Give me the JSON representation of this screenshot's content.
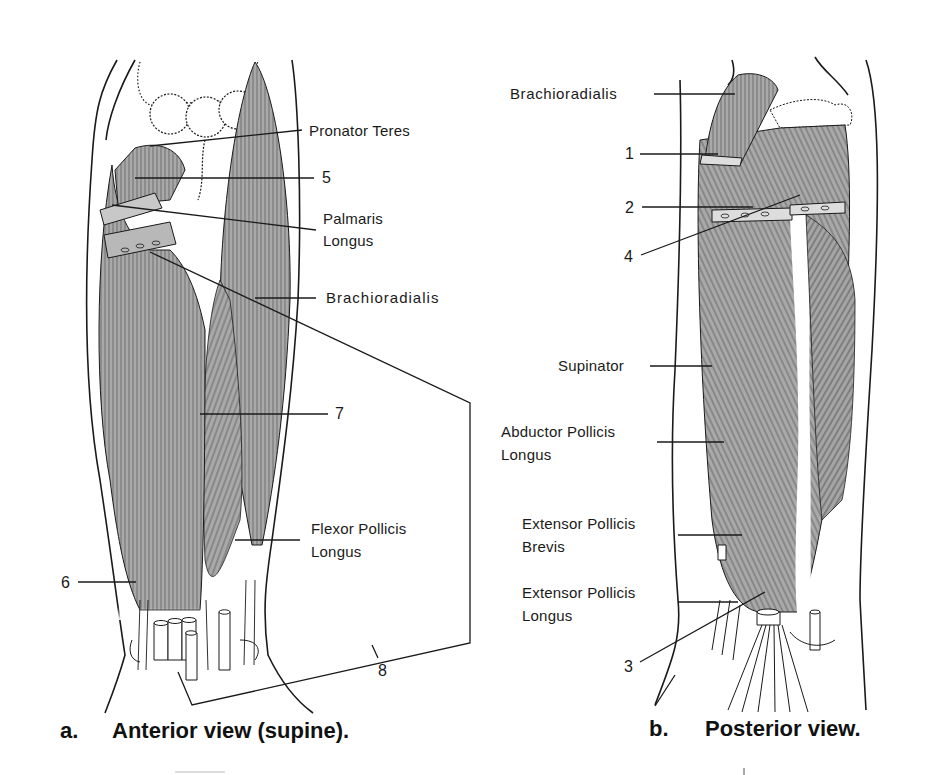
{
  "figure": {
    "panels": [
      {
        "id": "a",
        "caption_prefix": "a.",
        "caption": "Anterior view (supine).",
        "labels": {
          "pronator_teres": "Pronator Teres",
          "n5": "5",
          "palmaris_longus_1": "Palmaris",
          "palmaris_longus_2": "Longus",
          "brachioradialis": "Brachioradialis",
          "n7": "7",
          "flexor_pollicis_longus_1": "Flexor Pollicis",
          "flexor_pollicis_longus_2": "Longus",
          "n6": "6",
          "n8": "8"
        }
      },
      {
        "id": "b",
        "caption_prefix": "b.",
        "caption": "Posterior view.",
        "labels": {
          "brachioradialis": "Brachioradialis",
          "n1": "1",
          "n2": "2",
          "n4": "4",
          "supinator": "Supinator",
          "abductor_pollicis_longus_1": "Abductor Pollicis",
          "abductor_pollicis_longus_2": "Longus",
          "extensor_pollicis_brevis_1": "Extensor Pollicis",
          "extensor_pollicis_brevis_2": "Brevis",
          "extensor_pollicis_longus_1": "Extensor Pollicis",
          "extensor_pollicis_longus_2": "Longus",
          "n3": "3"
        }
      }
    ],
    "colors": {
      "muscle": "#a8a8a8",
      "line": "#1a1a1a",
      "background": "#ffffff"
    }
  }
}
